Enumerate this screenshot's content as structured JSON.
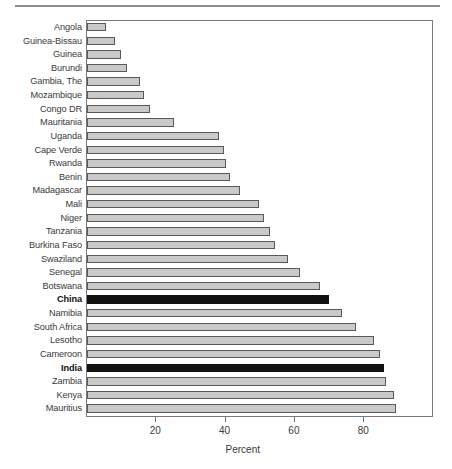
{
  "chart_data": {
    "type": "bar",
    "orientation": "horizontal",
    "title": "",
    "xlabel": "Percent",
    "ylabel": "",
    "xlim": [
      0,
      100
    ],
    "xticks": [
      20,
      40,
      60,
      80
    ],
    "xtick_labels": [
      "20",
      "40",
      "60",
      "80"
    ],
    "grid": false,
    "legend": null,
    "colors": {
      "bar_fill": "#c9c9c9",
      "bar_edge": "#5a5a5a",
      "highlight_fill": "#111111",
      "frame": "#7a7a7a",
      "text": "#3a3a3a"
    },
    "highlight_categories": [
      "China",
      "India"
    ],
    "categories": [
      "Angola",
      "Guinea-Bissau",
      "Guinea",
      "Burundi",
      "Gambia, The",
      "Mozambique",
      "Congo DR",
      "Mauritania",
      "Uganda",
      "Cape Verde",
      "Rwanda",
      "Benin",
      "Madagascar",
      "Mali",
      "Niger",
      "Tanzania",
      "Burkina Faso",
      "Swaziland",
      "Senegal",
      "Botswana",
      "China",
      "Namibia",
      "South Africa",
      "Lesotho",
      "Cameroon",
      "India",
      "Zambia",
      "Kenya",
      "Mauritius"
    ],
    "values": [
      5.6,
      8.0,
      9.7,
      11.6,
      15.2,
      16.4,
      18.3,
      25.0,
      38.2,
      39.5,
      40.0,
      41.2,
      44.1,
      49.5,
      51.0,
      52.9,
      54.4,
      58.1,
      61.5,
      67.3,
      69.9,
      73.5,
      77.6,
      82.9,
      84.6,
      85.6,
      86.2,
      88.6,
      89.1
    ]
  }
}
